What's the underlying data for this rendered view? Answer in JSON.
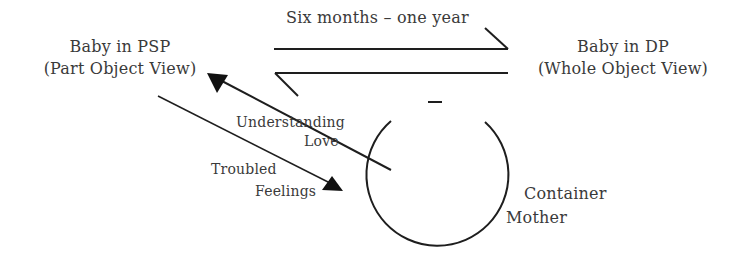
{
  "diagram": {
    "left_node": {
      "line1": "Baby in PSP",
      "line2": "(Part Object View)"
    },
    "right_node": {
      "line1": "Baby in DP",
      "line2": "(Whole Object View)"
    },
    "top_label": "Six months – one year",
    "understanding": {
      "line1": "Understanding",
      "line2": "Love"
    },
    "troubled": {
      "line1": "Troubled",
      "line2": "Feelings"
    },
    "container": {
      "line1": "Container",
      "line2": "Mother"
    },
    "colors": {
      "stroke": "#1e1e1e",
      "text": "#3a3a3a",
      "background": "#ffffff"
    }
  }
}
